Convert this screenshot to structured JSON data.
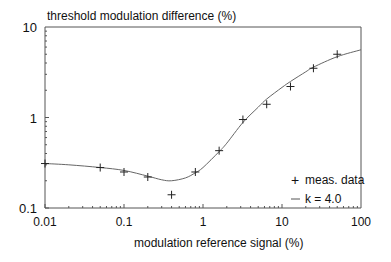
{
  "chart_data": {
    "type": "line",
    "title": "",
    "ylabel": "threshold modulation difference (%)",
    "xlabel": "modulation reference signal  (%)",
    "xscale": "log",
    "yscale": "log",
    "xlim": [
      0.01,
      100
    ],
    "ylim": [
      0.1,
      10
    ],
    "x_ticks": [
      "0.01",
      "0.1",
      "1",
      "10",
      "100"
    ],
    "y_ticks": [
      "0.1",
      "1",
      "10"
    ],
    "grid": false,
    "legend_position": "lower right",
    "series": [
      {
        "name": "meas. data",
        "style": "markers",
        "marker": "+",
        "x": [
          0.01,
          0.05,
          0.1,
          0.2,
          0.4,
          0.8,
          1.6,
          3.2,
          6.4,
          12.8,
          25,
          50
        ],
        "y": [
          0.31,
          0.28,
          0.25,
          0.22,
          0.14,
          0.25,
          0.43,
          0.95,
          1.4,
          2.2,
          3.5,
          5.0
        ]
      },
      {
        "name": "k = 4.0",
        "style": "line",
        "x": [
          0.01,
          0.02,
          0.05,
          0.1,
          0.2,
          0.3,
          0.4,
          0.6,
          0.8,
          1.0,
          1.6,
          2.0,
          3.2,
          5,
          6.4,
          10,
          12.8,
          20,
          25,
          50,
          100
        ],
        "y": [
          0.31,
          0.3,
          0.28,
          0.26,
          0.225,
          0.205,
          0.2,
          0.215,
          0.245,
          0.28,
          0.42,
          0.52,
          0.88,
          1.3,
          1.6,
          2.15,
          2.5,
          3.2,
          3.6,
          4.7,
          5.6
        ]
      }
    ]
  },
  "legend": {
    "items": [
      {
        "symbol": "+",
        "label": "meas. data"
      },
      {
        "symbol": "—",
        "label": "k = 4.0"
      }
    ]
  },
  "axes": {
    "ylabel": "threshold modulation difference (%)",
    "xlabel": "modulation reference signal  (%)",
    "x_tick_labels": [
      "0.01",
      "0.1",
      "1",
      "10",
      "100"
    ],
    "y_tick_labels": [
      "0.1",
      "1",
      "10"
    ]
  },
  "colors": {
    "axis": "#555555",
    "line": "#666666",
    "marker": "#222222",
    "text": "#111111"
  }
}
